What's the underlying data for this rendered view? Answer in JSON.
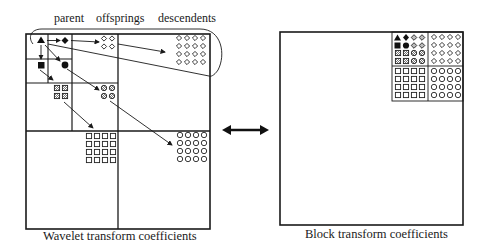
{
  "labels": {
    "parent": "parent",
    "offsprings": "offsprings",
    "descendents": "descendents"
  },
  "captions": {
    "left": "Wavelet transform coefficients",
    "right": "Block transform coefficients"
  },
  "legend_symbols": {
    "parent": "filled-triangle",
    "level1_children": [
      "filled-diamond",
      "filled-square",
      "filled-circle"
    ],
    "level2": [
      "hatched-diamond",
      "hatched-square",
      "hatched-circle"
    ],
    "level3": [
      "open-diamond",
      "open-square",
      "open-circle"
    ]
  },
  "arrow_between": "double-headed-arrow",
  "colors": {
    "line": "#1a1a1a",
    "background": "#ffffff",
    "hatch": "#9a9a9a"
  }
}
